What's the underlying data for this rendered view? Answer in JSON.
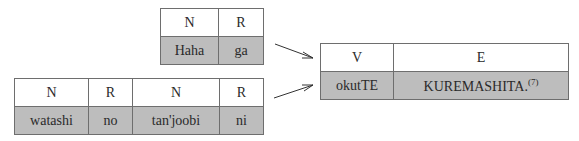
{
  "top_table": {
    "headers": [
      "N",
      "R"
    ],
    "cells": [
      "Haha",
      "ga"
    ]
  },
  "bottom_table": {
    "headers": [
      "N",
      "R",
      "N",
      "R"
    ],
    "cells": [
      "watashi",
      "no",
      "tan'joobi",
      "ni"
    ]
  },
  "result_table": {
    "headers": [
      "V",
      "E"
    ],
    "cells": [
      "okutTE",
      "KUREMASHITA."
    ],
    "footnote": "(7)"
  },
  "colors": {
    "header_bg": "#ffffff",
    "body_bg": "#bdbdbd",
    "border": "#6e6e6e",
    "arrow": "#333333"
  }
}
